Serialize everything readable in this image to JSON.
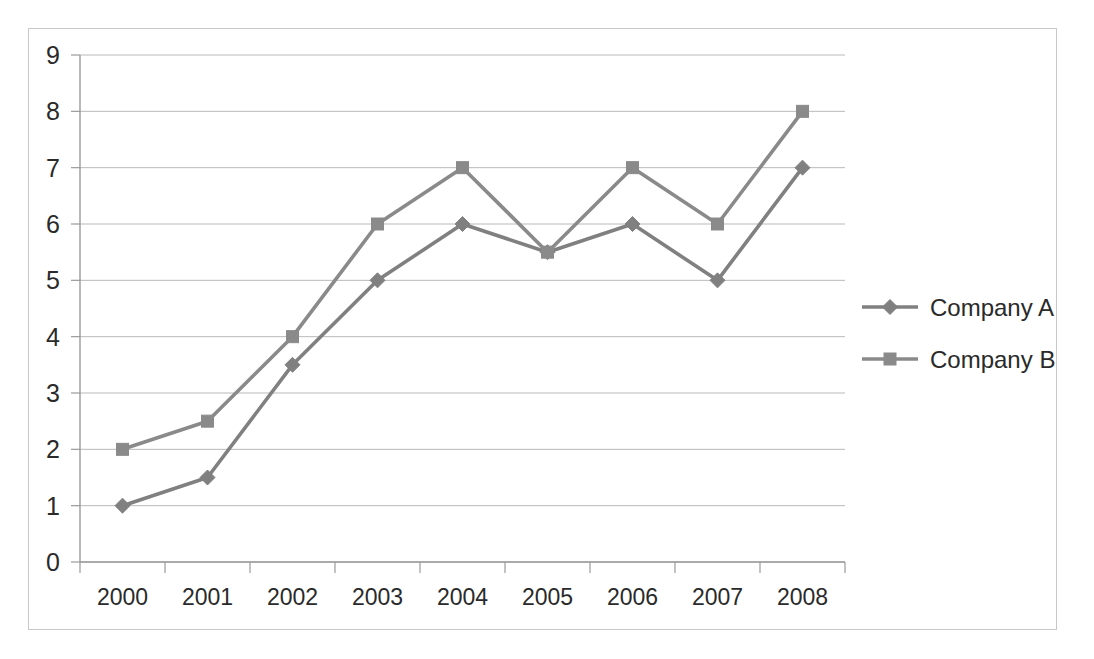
{
  "chart_data": {
    "type": "line",
    "title": "",
    "subtitle": "",
    "xlabel": "",
    "ylabel": "",
    "categories": [
      "2000",
      "2001",
      "2002",
      "2003",
      "2004",
      "2005",
      "2006",
      "2007",
      "2008"
    ],
    "series": [
      {
        "name": "Company A",
        "marker": "diamond",
        "color": "#808080",
        "values": [
          1,
          1.5,
          3.5,
          5,
          6,
          5.5,
          6,
          5,
          7
        ]
      },
      {
        "name": "Company B",
        "marker": "square",
        "color": "#8a8a8a",
        "values": [
          2,
          2.5,
          4,
          6,
          7,
          5.5,
          7,
          6,
          8
        ]
      }
    ],
    "ylim": [
      0,
      9
    ],
    "ytick_labels": [
      "0",
      "1",
      "2",
      "3",
      "4",
      "5",
      "6",
      "7",
      "8",
      "9"
    ],
    "ytick_values": [
      0,
      1,
      2,
      3,
      4,
      5,
      6,
      7,
      8,
      9
    ],
    "grid": true,
    "grid_axis": "y",
    "legend_position": "right",
    "legend_entries": [
      "Company A",
      "Company B"
    ]
  },
  "colors": {
    "series_a": "#808080",
    "series_b": "#8a8a8a",
    "gridline": "#b9b9b9",
    "axis": "#9a9a9a",
    "frame_border": "#c8c8c8",
    "text": "#2a2a2a",
    "background": "#ffffff"
  }
}
